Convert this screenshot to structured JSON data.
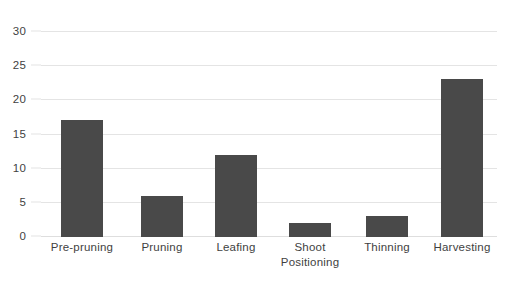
{
  "chart_data": {
    "type": "bar",
    "title": "",
    "subtitle": "",
    "xlabel": "",
    "ylabel": "",
    "categories": [
      "Pre-pruning",
      "Pruning",
      "Leafing",
      "Shoot\nPositioning",
      "Thinning",
      "Harvesting"
    ],
    "values": [
      17,
      6,
      12,
      2,
      3,
      23
    ],
    "ylim": [
      0,
      30
    ],
    "ytick_labels": [
      "0",
      "5",
      "10",
      "15",
      "20",
      "25",
      "30"
    ],
    "ytick_values": [
      0,
      5,
      10,
      15,
      20,
      25,
      30
    ],
    "grid": true,
    "grid_axis": "y",
    "legend": false,
    "legend_position": "none",
    "bar_color": "#494949",
    "grid_color": "#e4e4e4",
    "text_color": "#3f3f3f",
    "background_color": "#ffffff"
  }
}
